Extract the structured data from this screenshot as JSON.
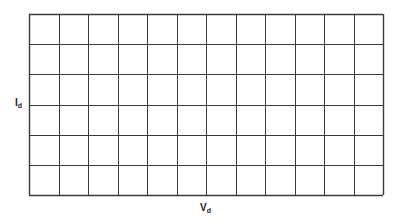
{
  "diagram": {
    "type": "blank characteristic-curve grid",
    "grid": {
      "columns": 12,
      "rows": 6,
      "line_color": "#3a3a3a",
      "background": "#ffffff"
    },
    "y_axis": {
      "symbol": "I",
      "subscript": "d"
    },
    "x_axis": {
      "symbol": "V",
      "subscript": "d"
    }
  }
}
